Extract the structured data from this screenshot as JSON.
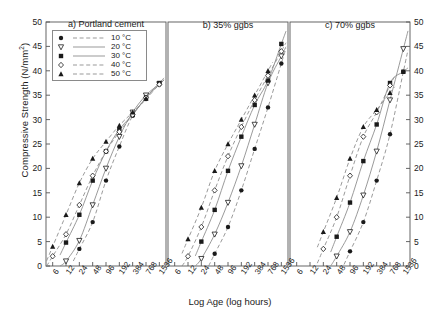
{
  "chart_data": {
    "type": "scatter",
    "title": "",
    "xlabel": "Log Age (log hours)",
    "ylabel": "Compressive Strength (N/mm2)",
    "ylabel_html": "Compressive Strength (N/mm",
    "ylabel_sup": "2",
    "ylabel_tail": ")",
    "xticklabels": [
      "6",
      "12",
      "24",
      "48",
      "96",
      "192",
      "384",
      "768",
      "1536"
    ],
    "xtickvalues": [
      6,
      12,
      24,
      48,
      96,
      192,
      384,
      768,
      1536
    ],
    "yticklabels": [
      "0",
      "5",
      "10",
      "15",
      "20",
      "25",
      "30",
      "35",
      "40",
      "45",
      "50"
    ],
    "ylim": [
      0,
      50
    ],
    "xlim": [
      4.24,
      2172
    ],
    "xscale": "log2",
    "grid": false,
    "legend_position": "top-left-panel-a",
    "legend": [
      {
        "label": "10 °C",
        "marker": "filled-circle",
        "line": "dashed"
      },
      {
        "label": "20 °C",
        "marker": "open-triangle-down",
        "line": "solid"
      },
      {
        "label": "30 °C",
        "marker": "filled-square",
        "line": "solid"
      },
      {
        "label": "40 °C",
        "marker": "open-diamond",
        "line": "dashed"
      },
      {
        "label": "50 °C",
        "marker": "filled-triangle-up",
        "line": "dashed"
      }
    ],
    "panels": [
      {
        "id": "a",
        "title": "a) Portland cement",
        "series": [
          {
            "name": "10 °C",
            "marker": "filled-circle",
            "line": "dashed",
            "x": [
              24,
              48,
              96,
              192,
              384,
              768,
              1536
            ],
            "y": [
              3.5,
              9.0,
              17.5,
              24.5,
              30.8,
              34.2,
              37.2
            ]
          },
          {
            "name": "20 °C",
            "marker": "open-triangle-down",
            "line": "solid",
            "x": [
              12,
              24,
              48,
              96,
              192,
              384,
              768,
              1536
            ],
            "y": [
              1.0,
              5.2,
              12.5,
              20.0,
              26.5,
              31.5,
              35.0,
              37.3
            ]
          },
          {
            "name": "30 °C",
            "marker": "filled-square",
            "line": "solid",
            "x": [
              12,
              24,
              48,
              96,
              192,
              384,
              768,
              1536
            ],
            "y": [
              4.8,
              10.5,
              17.5,
              23.5,
              28.0,
              31.0,
              34.5,
              37.5
            ]
          },
          {
            "name": "40 °C",
            "marker": "open-diamond",
            "line": "dashed",
            "x": [
              6,
              12,
              24,
              48,
              96,
              192,
              384,
              768,
              1536
            ],
            "y": [
              2.0,
              6.5,
              12.5,
              18.5,
              23.5,
              27.5,
              31.0,
              34.5,
              37.2
            ]
          },
          {
            "name": "50 °C",
            "marker": "filled-triangle-up",
            "line": "dashed",
            "x": [
              6,
              12,
              24,
              48,
              96,
              192,
              384,
              768
            ],
            "y": [
              4.0,
              10.5,
              17.0,
              22.0,
              25.5,
              28.8,
              31.5,
              34.3
            ]
          }
        ]
      },
      {
        "id": "b",
        "title": "b) 35% ggbs",
        "series": [
          {
            "name": "10 °C",
            "marker": "filled-circle",
            "line": "dashed",
            "x": [
              48,
              96,
              192,
              384,
              768,
              1536
            ],
            "y": [
              2.5,
              8.0,
              15.5,
              24.0,
              32.5,
              41.5
            ]
          },
          {
            "name": "20 °C",
            "marker": "open-triangle-down",
            "line": "solid",
            "x": [
              24,
              48,
              96,
              192,
              384,
              768,
              1536
            ],
            "y": [
              1.5,
              6.5,
              13.0,
              20.5,
              29.0,
              37.5,
              43.0
            ]
          },
          {
            "name": "30 °C",
            "marker": "filled-square",
            "line": "solid",
            "x": [
              24,
              48,
              96,
              192,
              384,
              768,
              1536
            ],
            "y": [
              5.0,
              11.5,
              19.5,
              26.5,
              33.0,
              38.0,
              45.5
            ]
          },
          {
            "name": "40 °C",
            "marker": "open-diamond",
            "line": "dashed",
            "x": [
              12,
              24,
              48,
              96,
              192,
              384,
              768,
              1536
            ],
            "y": [
              2.0,
              8.0,
              15.5,
              22.5,
              28.5,
              34.0,
              39.0,
              44.0
            ]
          },
          {
            "name": "50 °C",
            "marker": "filled-triangle-up",
            "line": "dashed",
            "x": [
              12,
              24,
              48,
              96,
              192,
              384,
              768
            ],
            "y": [
              5.5,
              12.0,
              19.5,
              25.0,
              30.0,
              35.0,
              40.0
            ]
          }
        ]
      },
      {
        "id": "c",
        "title": "c) 70% ggbs",
        "series": [
          {
            "name": "10 °C",
            "marker": "filled-circle",
            "line": "dashed",
            "x": [
              96,
              192,
              384,
              768,
              1536
            ],
            "y": [
              3.0,
              9.0,
              17.5,
              27.0,
              39.8
            ]
          },
          {
            "name": "20 °C",
            "marker": "open-triangle-down",
            "line": "solid",
            "x": [
              48,
              96,
              192,
              384,
              768,
              1536
            ],
            "y": [
              2.0,
              7.0,
              14.5,
              23.5,
              34.0,
              44.5
            ]
          },
          {
            "name": "30 °C",
            "marker": "filled-square",
            "line": "solid",
            "x": [
              48,
              96,
              192,
              384,
              768,
              1536
            ],
            "y": [
              6.0,
              13.0,
              21.5,
              29.0,
              37.5,
              39.8
            ]
          },
          {
            "name": "40 °C",
            "marker": "open-diamond",
            "line": "dashed",
            "x": [
              24,
              48,
              96,
              192,
              384,
              768
            ],
            "y": [
              3.5,
              10.0,
              18.5,
              26.5,
              31.5,
              37.0
            ]
          },
          {
            "name": "50 °C",
            "marker": "filled-triangle-up",
            "line": "dashed",
            "x": [
              24,
              48,
              96,
              192,
              384,
              768
            ],
            "y": [
              7.0,
              14.0,
              22.0,
              28.5,
              32.0,
              35.5
            ]
          }
        ]
      }
    ]
  },
  "style": {
    "axis_color": "#555555",
    "line_color": "#888888",
    "marker_color": "#1a1a1a",
    "background": "#ffffff"
  }
}
